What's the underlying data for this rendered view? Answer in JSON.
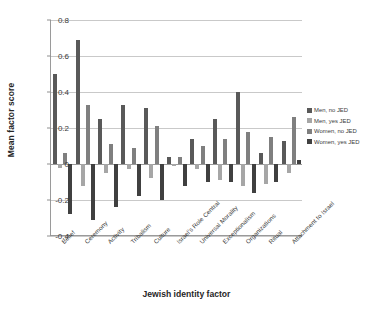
{
  "chart_data": {
    "type": "bar",
    "title": "",
    "xlabel": "Jewish identity factor",
    "ylabel": "Mean factor score",
    "ylim": [
      -0.4,
      0.8
    ],
    "yticks": [
      "0.8",
      "0.6",
      "0.4",
      "0.2",
      "0",
      "-0.2",
      "-0.4"
    ],
    "ytick_values": [
      0.8,
      0.6,
      0.4,
      0.2,
      0,
      -0.2,
      -0.4
    ],
    "grid": true,
    "legend_position": "right",
    "categories": [
      "Belief",
      "Ceremony",
      "Activity",
      "Tribalism",
      "Culture",
      "Israel's Role Central",
      "Universal Morality",
      "Exceptionalism",
      "Organizations",
      "Ritual",
      "Attachment to Israel"
    ],
    "series": [
      {
        "name": "Men, no JED",
        "color": "#595959",
        "values": [
          0.5,
          0.69,
          0.25,
          0.33,
          0.31,
          0.04,
          0.14,
          0.25,
          0.4,
          0.06,
          0.13
        ]
      },
      {
        "name": "Men, yes JED",
        "color": "#a6a6a6",
        "values": [
          -0.02,
          -0.12,
          -0.05,
          -0.03,
          -0.08,
          -0.01,
          -0.03,
          -0.09,
          -0.12,
          -0.11,
          -0.05
        ]
      },
      {
        "name": "Women, no JED",
        "color": "#7f7f7f",
        "values": [
          0.06,
          0.33,
          0.11,
          0.09,
          0.21,
          0.04,
          0.1,
          0.14,
          0.18,
          0.15,
          0.26
        ]
      },
      {
        "name": "Women, yes JED",
        "color": "#404040",
        "values": [
          -0.28,
          -0.31,
          -0.24,
          -0.18,
          -0.2,
          -0.12,
          -0.1,
          -0.1,
          -0.16,
          -0.1,
          0.02
        ]
      }
    ]
  },
  "legend": {
    "items": [
      {
        "label": "Men, no JED",
        "color": "#595959"
      },
      {
        "label": "Men, yes JED",
        "color": "#a6a6a6"
      },
      {
        "label": "Women, no JED",
        "color": "#7f7f7f"
      },
      {
        "label": "Women, yes JED",
        "color": "#404040"
      }
    ]
  },
  "axes": {
    "y_title": "Mean factor score",
    "x_title": "Jewish identity factor"
  }
}
